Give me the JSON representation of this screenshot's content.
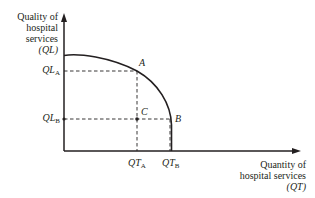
{
  "diagram": {
    "type": "production-possibility-frontier",
    "y_axis": {
      "label_lines": [
        "Quality of",
        "hospital",
        "services",
        "(QL)"
      ],
      "symbol": "QL"
    },
    "x_axis": {
      "label_lines": [
        "Quantity of",
        "hospital services",
        "(QT)"
      ],
      "symbol": "QT"
    },
    "ticks": {
      "y": [
        {
          "base": "QL",
          "sub": "A"
        },
        {
          "base": "QL",
          "sub": "B"
        }
      ],
      "x": [
        {
          "base": "QT",
          "sub": "A"
        },
        {
          "base": "QT",
          "sub": "B"
        }
      ]
    },
    "points": [
      {
        "label": "A",
        "on_curve": true
      },
      {
        "label": "B",
        "on_curve": true
      },
      {
        "label": "C",
        "on_curve": false
      }
    ],
    "colors": {
      "ink": "#231f20",
      "background": "#ffffff"
    }
  }
}
